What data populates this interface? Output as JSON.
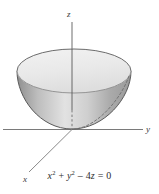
{
  "figure": {
    "title_fragment": "",
    "axes": {
      "z_label": "z",
      "y_label": "y",
      "x_label": "x"
    },
    "equation": {
      "term1_var": "x",
      "term1_exp": "2",
      "plus": " + ",
      "term2_var": "y",
      "term2_exp": "2",
      "minus": " – ",
      "coefficient": "4",
      "term3_var": "z",
      "equals": " = ",
      "rhs": "0",
      "full_text": "x2 + y2 – 4z = 0"
    },
    "surface": {
      "name": "elliptic-paraboloid",
      "description": "bowl opening upward",
      "top_fill": "#ededed",
      "body_fill": "#b7b7b7",
      "outline": "#5a5a5a",
      "hidden_edge_style": "dashed"
    },
    "colors": {
      "axis": "#7a7a7a",
      "text": "#2e2e2e",
      "background": "#ffffff"
    }
  }
}
